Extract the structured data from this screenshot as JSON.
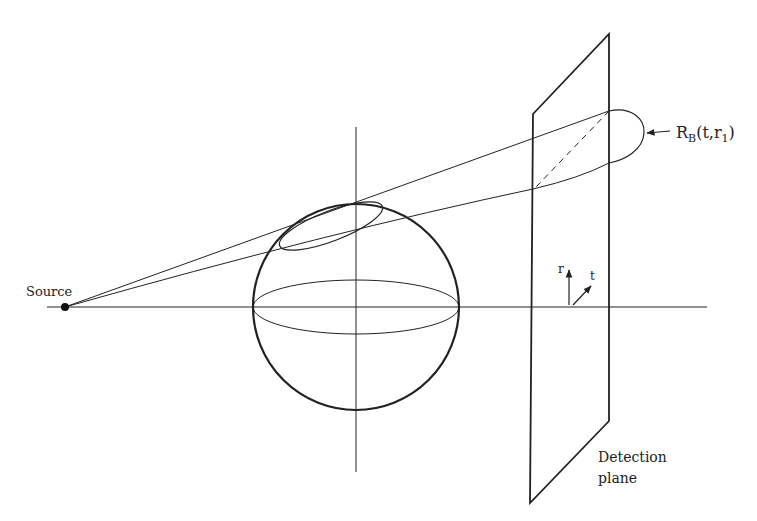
{
  "diagram": {
    "labels": {
      "source": "Source",
      "rb_main": "R",
      "rb_sub": "B",
      "rb_args_open": "(t,r",
      "rb_args_sub": "1",
      "rb_args_close": ")",
      "axis_r": "r",
      "axis_t": "t",
      "detection_line1": "Detection",
      "detection_line2": "plane"
    },
    "colors": {
      "stroke": "#222222",
      "background": "#ffffff"
    }
  }
}
